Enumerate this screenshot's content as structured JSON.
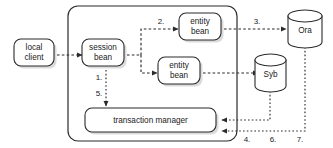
{
  "diagram": {
    "nodes": {
      "local_client": {
        "label_line1": "local",
        "label_line2": "client"
      },
      "session_bean": {
        "label_line1": "session",
        "label_line2": "bean"
      },
      "entity_bean_top": {
        "label_line1": "entity",
        "label_line2": "bean"
      },
      "entity_bean_bottom": {
        "label_line1": "entity",
        "label_line2": "bean"
      },
      "transaction_manager": {
        "label": "transaction manager"
      },
      "database_ora": {
        "label": "Ora"
      },
      "database_syb": {
        "label": "Syb"
      }
    },
    "step_labels": {
      "step1": "1.",
      "step2": "2.",
      "step3": "3.",
      "step4": "4.",
      "step5": "5.",
      "step6": "6.",
      "step7": "7."
    },
    "colors": {
      "stroke": "#2b2b2b",
      "fill": "#ffffff",
      "shadow": "#bdbdbd",
      "text": "#1a1a1a"
    }
  }
}
